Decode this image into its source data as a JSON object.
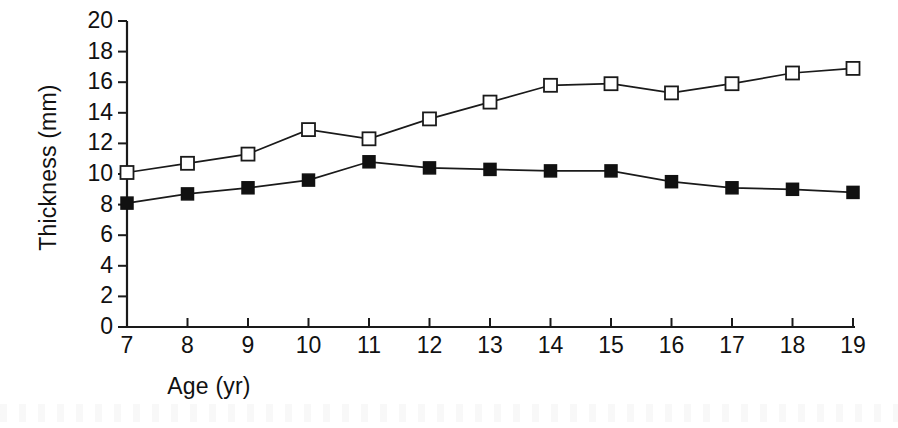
{
  "chart_data": {
    "type": "line",
    "title": "",
    "subtitle": "",
    "xlabel": "Age (yr)",
    "ylabel": "Thickness (mm)",
    "x": [
      7,
      8,
      9,
      10,
      11,
      12,
      13,
      14,
      15,
      16,
      17,
      18,
      19
    ],
    "xtick_labels": [
      "7",
      "8",
      "9",
      "10",
      "11",
      "12",
      "13",
      "14",
      "15",
      "16",
      "17",
      "18",
      "19"
    ],
    "ytick_labels": [
      "20",
      "18",
      "16",
      "14",
      "12",
      "10",
      "8",
      "6",
      "4",
      "2",
      "0"
    ],
    "ytick_values": [
      20,
      18,
      16,
      14,
      12,
      10,
      8,
      6,
      4,
      2,
      0
    ],
    "xlim": [
      7,
      19
    ],
    "ylim": [
      0,
      20
    ],
    "grid": false,
    "legend": "none",
    "annotations": [],
    "series": [
      {
        "name": "open-square-series",
        "marker": "open-square",
        "color": "#111111",
        "values": [
          10.1,
          10.7,
          11.3,
          12.9,
          12.3,
          13.6,
          14.7,
          15.8,
          15.9,
          15.3,
          15.9,
          16.6,
          16.9
        ]
      },
      {
        "name": "filled-square-series",
        "marker": "filled-square",
        "color": "#111111",
        "values": [
          8.1,
          8.7,
          9.1,
          9.6,
          10.8,
          10.4,
          10.3,
          10.2,
          10.2,
          9.5,
          9.1,
          9.0,
          8.8
        ]
      }
    ]
  }
}
